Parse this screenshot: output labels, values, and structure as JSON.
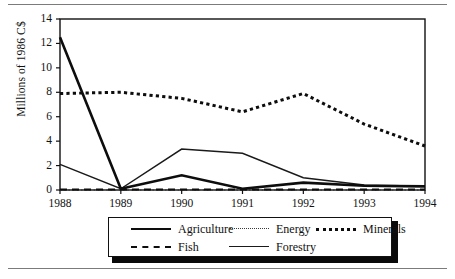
{
  "chart_data": {
    "type": "line",
    "title": "",
    "xlabel": "",
    "ylabel": "Millions of 1986 C$",
    "categories": [
      "1988",
      "1989",
      "1990",
      "1991",
      "1992",
      "1993",
      "1994"
    ],
    "x": [
      1988,
      1989,
      1990,
      1991,
      1992,
      1993,
      1994
    ],
    "xlim": [
      1988,
      1994
    ],
    "ylim": [
      0,
      14
    ],
    "yticks": [
      0,
      2,
      4,
      6,
      8,
      10,
      12,
      14
    ],
    "ytick_labels": [
      "0",
      "2",
      "4",
      "6",
      "8",
      "10",
      "12",
      "14"
    ],
    "xtick_labels": [
      "1988",
      "1989",
      "1990",
      "1991",
      "1992",
      "1993",
      "1994"
    ],
    "grid": false,
    "legend_position": "below-axes",
    "series": [
      {
        "name": "Agriculture",
        "style": "solid-thick",
        "color": "#0d0d0d",
        "values": [
          12.5,
          0.1,
          1.2,
          0.1,
          0.6,
          0.35,
          0.3
        ]
      },
      {
        "name": "Energy",
        "style": "fine-dotted",
        "color": "#3a3a3a",
        "values": [
          0.0,
          0.0,
          0.0,
          0.0,
          0.0,
          0.0,
          0.0
        ]
      },
      {
        "name": "Minerals",
        "style": "bold-dotted",
        "color": "#0d0d0d",
        "values": [
          7.9,
          8.0,
          7.5,
          6.4,
          7.9,
          5.4,
          3.6
        ]
      },
      {
        "name": "Fish",
        "style": "dashed",
        "color": "#0d0d0d",
        "values": [
          0.05,
          0.05,
          0.05,
          0.05,
          0.05,
          0.05,
          0.05
        ]
      },
      {
        "name": "Forestry",
        "style": "solid-thin",
        "color": "#1a1a1a",
        "values": [
          2.1,
          0.1,
          3.35,
          3.0,
          1.0,
          0.4,
          0.3
        ]
      }
    ]
  },
  "legend": {
    "items": [
      {
        "label": "Agriculture",
        "key": "agriculture"
      },
      {
        "label": "Energy",
        "key": "energy"
      },
      {
        "label": "Minerals",
        "key": "minerals"
      },
      {
        "label": "Fish",
        "key": "fish"
      },
      {
        "label": "Forestry",
        "key": "forestry"
      }
    ]
  },
  "axis": {
    "y_title": "Millions of 1986 C$"
  }
}
